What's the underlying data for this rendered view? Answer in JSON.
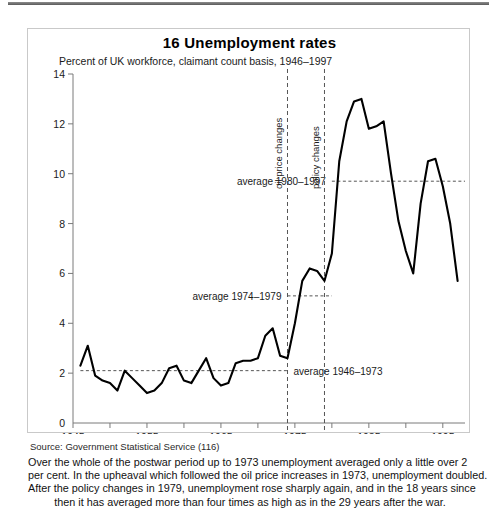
{
  "title": "16 Unemployment rates",
  "subtitle": "Percent of UK workforce, claimant count basis, 1946–1997",
  "source": "Source: Government Statistical Service (116)",
  "caption": {
    "line1": "Over the whole of the postwar period up to 1973 unemployment averaged only a little over 2",
    "line2": "per cent. In the upheaval which followed the oil price increases in 1973, unemployment doubled.",
    "line3": "After the policy changes in 1979, unemployment rose sharply again, and in the 18 years since",
    "line4": "then it has averaged more than four times as high as in the 29 years after the war."
  },
  "annotations": {
    "oil_price": "oil price changes",
    "policy": "policy changes",
    "avg_1980_1997": "average 1980–1997",
    "avg_1974_1979": "average 1974–1979",
    "avg_1946_1973": "average 1946–1973"
  },
  "colors": {
    "line": "#000000",
    "axis": "#7a7a7a",
    "dashed": "#555555",
    "border": "#c9c9c9",
    "text": "#1a1a1a"
  },
  "chart_data": {
    "type": "line",
    "title": "16 Unemployment rates",
    "subtitle": "Percent of UK workforce, claimant count basis, 1946–1997",
    "xlabel": "",
    "ylabel": "Percent of UK workforce, claimant count basis",
    "xlim": [
      1945,
      1998
    ],
    "ylim": [
      0,
      14
    ],
    "yticks": [
      0,
      2,
      4,
      6,
      8,
      10,
      12,
      14
    ],
    "ytick_labels": [
      "0",
      "2",
      "4",
      "6",
      "8",
      "10",
      "12",
      "14"
    ],
    "xticks": [
      1945,
      1950,
      1955,
      1960,
      1965,
      1970,
      1975,
      1980,
      1985,
      1990,
      1995
    ],
    "xtick_labels": [
      "1945",
      "",
      "1955",
      "",
      "1965",
      "",
      "1975",
      "",
      "1985",
      "",
      "1995"
    ],
    "grid": false,
    "legend": "none",
    "series": [
      {
        "name": "UK unemployment rate (claimant count)",
        "x": [
          1946,
          1947,
          1948,
          1949,
          1950,
          1951,
          1952,
          1953,
          1954,
          1955,
          1956,
          1957,
          1958,
          1959,
          1960,
          1961,
          1962,
          1963,
          1964,
          1965,
          1966,
          1967,
          1968,
          1969,
          1970,
          1971,
          1972,
          1973,
          1974,
          1975,
          1976,
          1977,
          1978,
          1979,
          1980,
          1981,
          1982,
          1983,
          1984,
          1985,
          1986,
          1987,
          1988,
          1989,
          1990,
          1991,
          1992,
          1993,
          1994,
          1995,
          1996,
          1997
        ],
        "values": [
          2.3,
          3.1,
          1.9,
          1.7,
          1.6,
          1.3,
          2.1,
          1.8,
          1.5,
          1.2,
          1.3,
          1.6,
          2.2,
          2.3,
          1.7,
          1.6,
          2.1,
          2.6,
          1.8,
          1.5,
          1.6,
          2.4,
          2.5,
          2.5,
          2.6,
          3.5,
          3.8,
          2.7,
          2.6,
          4.0,
          5.7,
          6.2,
          6.1,
          5.7,
          6.8,
          10.5,
          12.1,
          12.9,
          13.0,
          11.8,
          11.9,
          12.1,
          10.0,
          8.1,
          6.9,
          6.0,
          8.8,
          10.5,
          10.6,
          9.5,
          8.0,
          5.7
        ]
      }
    ],
    "reference_lines": [
      {
        "label": "average 1946–1973",
        "value": 2.1,
        "orientation": "horizontal",
        "x_from": 1946,
        "x_to": 1974,
        "style": "dashed"
      },
      {
        "label": "average 1974–1979",
        "value": 5.1,
        "orientation": "horizontal",
        "x_from": 1974,
        "x_to": 1980,
        "style": "dashed"
      },
      {
        "label": "average 1980–1997",
        "value": 9.7,
        "orientation": "horizontal",
        "x_from": 1980,
        "x_to": 1998,
        "style": "dashed"
      }
    ],
    "event_lines": [
      {
        "label": "oil price changes",
        "year": 1974,
        "style": "dashed"
      },
      {
        "label": "policy changes",
        "year": 1979,
        "style": "dashed"
      }
    ]
  }
}
